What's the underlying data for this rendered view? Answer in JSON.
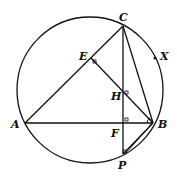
{
  "diagram": {
    "type": "geometry",
    "circle": {
      "cx": 90,
      "cy": 90,
      "r": 73
    },
    "points": {
      "A": {
        "x": 25,
        "y": 123,
        "label": "A",
        "lx": 11,
        "ly": 128
      },
      "B": {
        "x": 153,
        "y": 123,
        "label": "B",
        "lx": 158,
        "ly": 128
      },
      "C": {
        "x": 123,
        "y": 26,
        "label": "C",
        "lx": 119,
        "ly": 21
      },
      "E": {
        "x": 91,
        "y": 58,
        "label": "E",
        "lx": 79,
        "ly": 60
      },
      "H": {
        "x": 123,
        "y": 94,
        "label": "H",
        "lx": 111,
        "ly": 100
      },
      "F": {
        "x": 123,
        "y": 123,
        "label": "F",
        "lx": 111,
        "ly": 137
      },
      "P": {
        "x": 123,
        "y": 154,
        "label": "P",
        "lx": 118,
        "ly": 169
      },
      "X": {
        "x": 155,
        "y": 58,
        "label": "X",
        "lx": 160,
        "ly": 60
      }
    },
    "segments": [
      [
        "A",
        "B"
      ],
      [
        "A",
        "C"
      ],
      [
        "C",
        "P"
      ],
      [
        "C",
        "B"
      ],
      [
        "E",
        "B"
      ],
      [
        "B",
        "P"
      ]
    ],
    "right_angles": [
      "E",
      "H",
      "F",
      "P"
    ],
    "angle_marks": [
      "A",
      "B"
    ]
  }
}
